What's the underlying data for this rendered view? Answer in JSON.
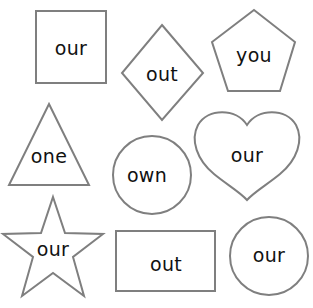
{
  "worksheet": {
    "colors": {
      "background": "#ffffff",
      "outline": "#7f7f7f",
      "text": "#111111"
    },
    "shapes": [
      {
        "shape": "square",
        "word": "our"
      },
      {
        "shape": "diamond",
        "word": "out"
      },
      {
        "shape": "pentagon",
        "word": "you"
      },
      {
        "shape": "triangle",
        "word": "one"
      },
      {
        "shape": "circle",
        "word": "own"
      },
      {
        "shape": "heart",
        "word": "our"
      },
      {
        "shape": "star",
        "word": "our"
      },
      {
        "shape": "rectangle",
        "word": "out"
      },
      {
        "shape": "circle",
        "word": "our"
      }
    ]
  }
}
